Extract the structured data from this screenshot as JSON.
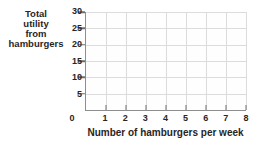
{
  "chart_data": {
    "type": "line",
    "title": "",
    "ylabel": "Total utility from hamburgers",
    "ylabel_lines": [
      "Total",
      "utility",
      "from",
      "hamburgers"
    ],
    "xlabel": "Number of hamburgers per week",
    "x_ticks": [
      "0",
      "1",
      "2",
      "3",
      "4",
      "5",
      "6",
      "7",
      "8"
    ],
    "y_ticks": [
      "5",
      "10",
      "15",
      "20",
      "25",
      "30"
    ],
    "xlim": [
      0,
      8
    ],
    "ylim": [
      0,
      30
    ],
    "grid": true,
    "legend_position": "none",
    "series": [],
    "note": "empty plotting grid — axes and gridlines only, no data series drawn"
  },
  "colors": {
    "axis": "#8e8e8e",
    "tick": "#6e6e6e",
    "grid": "#dcdcdc",
    "text": "#29251f",
    "plot_bg": "#fefefe",
    "page_bg": "#ffffff"
  }
}
